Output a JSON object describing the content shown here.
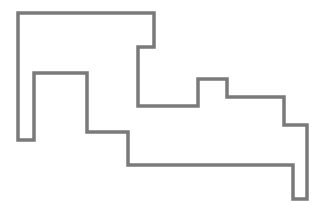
{
  "diagram": {
    "type": "rectilinear-polygon-outline",
    "stroke_color": "#7a7a7a",
    "stroke_width": 3.5,
    "fill": "none",
    "background": "#ffffff",
    "points": "18,13 154,13 154,47 138,47 138,106 198,106 198,79 227,79 227,97 284,97 284,125 307,125 307,199 293,199 293,165 128,165 128,132 87,132 87,73 34,73 34,140 18,140"
  }
}
